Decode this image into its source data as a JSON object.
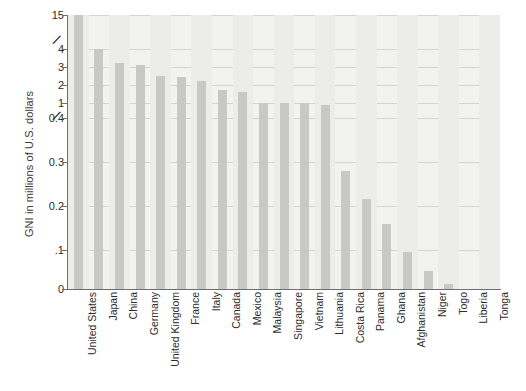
{
  "chart_data": {
    "type": "bar",
    "title": "",
    "subtitle": "",
    "xlabel": "",
    "ylabel": "GNI in millions of U.S. dollars",
    "axis_note": "Broken (non-linear) y-axis: two axis breaks, between 1 and 0.4, and between 4 and 15",
    "ytick_labels": [
      "15",
      "4",
      "3",
      "2",
      "1",
      "0.4",
      "0.3",
      "0.2",
      ".1",
      "0"
    ],
    "ylim": [
      0,
      15
    ],
    "grid": true,
    "legend": "none",
    "categories": [
      "United States",
      "Japan",
      "China",
      "Germany",
      "United Kingdom",
      "France",
      "Italy",
      "Canada",
      "Mexico",
      "Malaysia",
      "Singapore",
      "Vietnam",
      "Lithuania",
      "Costa Rica",
      "Panama",
      "Ghana",
      "Afghanistan",
      "Niger",
      "Togo",
      "Liberia",
      "Tonga"
    ],
    "values": [
      15.0,
      4.0,
      3.2,
      3.1,
      2.5,
      2.45,
      2.2,
      1.75,
      1.6,
      1.0,
      1.0,
      1.0,
      0.92,
      0.28,
      0.215,
      0.16,
      0.095,
      0.045,
      0.012,
      0.0,
      0.0
    ],
    "bar_color": "#c8c8c6",
    "plot_background": "#f2f2f0",
    "axis_color": "#6e6e6e",
    "gridline_color": "#d4d4d2"
  },
  "axis_breaks": [
    "⁄⁄",
    "⁄⁄"
  ]
}
